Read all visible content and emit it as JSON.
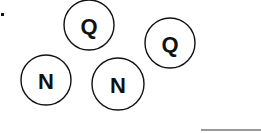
{
  "diagram": {
    "background": "#ffffff",
    "stroke_color": "#111111",
    "nodes": [
      {
        "id": "q1",
        "label": "Q",
        "cx": 89,
        "cy": 25,
        "r": 25
      },
      {
        "id": "q2",
        "label": "Q",
        "cx": 170,
        "cy": 43,
        "r": 25
      },
      {
        "id": "n1",
        "label": "N",
        "cx": 46,
        "cy": 80,
        "r": 25
      },
      {
        "id": "n2",
        "label": "N",
        "cx": 118,
        "cy": 84,
        "r": 26
      }
    ],
    "marks": [
      {
        "type": "dot",
        "x": 1,
        "y": 13,
        "w": 3,
        "h": 3
      }
    ],
    "lines": [
      {
        "x1": 201,
        "y1": 130,
        "x2": 261,
        "y2": 130
      }
    ]
  }
}
